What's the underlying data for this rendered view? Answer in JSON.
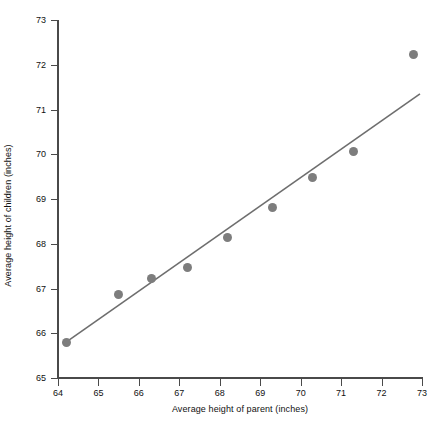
{
  "chart_data": {
    "type": "scatter",
    "title": "",
    "xlabel": "Average height of parent (inches)",
    "ylabel": "Average height of children (inches)",
    "xlim": [
      64,
      73
    ],
    "ylim": [
      65,
      73
    ],
    "xticks": [
      64,
      65,
      66,
      67,
      68,
      69,
      70,
      71,
      72,
      73
    ],
    "yticks": [
      65,
      66,
      67,
      68,
      69,
      70,
      71,
      72,
      73
    ],
    "xtick_labels": [
      "64",
      "65",
      "66",
      "67",
      "68",
      "69",
      "70",
      "71",
      "72",
      "73"
    ],
    "ytick_labels": [
      "65",
      "66",
      "67",
      "68",
      "69",
      "70",
      "71",
      "72",
      "73"
    ],
    "grid": false,
    "legend": null,
    "marker_color": "#7d7d7d",
    "line_color": "#6e6e6e",
    "axis_color": "#4a4a4a",
    "x": [
      64.2,
      65.5,
      66.3,
      67.2,
      68.2,
      69.3,
      70.3,
      71.3,
      72.8
    ],
    "y": [
      65.8,
      66.87,
      67.23,
      67.47,
      68.13,
      68.82,
      69.47,
      70.07,
      72.23
    ],
    "points": [
      {
        "x": 64.2,
        "y": 65.8
      },
      {
        "x": 65.5,
        "y": 66.87
      },
      {
        "x": 66.3,
        "y": 67.23
      },
      {
        "x": 67.2,
        "y": 67.47
      },
      {
        "x": 68.2,
        "y": 68.13
      },
      {
        "x": 69.3,
        "y": 68.82
      },
      {
        "x": 70.3,
        "y": 69.47
      },
      {
        "x": 71.3,
        "y": 70.07
      },
      {
        "x": 72.8,
        "y": 72.23
      }
    ],
    "trendline": {
      "type": "line",
      "x0": 64.2,
      "y0": 65.8,
      "x1": 72.95,
      "y1": 71.35
    }
  }
}
